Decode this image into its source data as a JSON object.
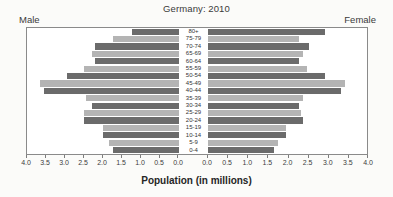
{
  "chart_data": {
    "type": "bar",
    "subtype": "population-pyramid",
    "title": "Germany: 2010",
    "xlabel": "Population (in millions)",
    "ylabel": "",
    "xlim": [
      0,
      4
    ],
    "grid": false,
    "legend_position": "none",
    "left_panel_label": "Male",
    "right_panel_label": "Female",
    "axis_ticks": [
      "0.0",
      "0.5",
      "1.0",
      "1.5",
      "2.0",
      "2.5",
      "3.0",
      "3.5",
      "4.0"
    ],
    "axis_tick_values": [
      0.0,
      0.5,
      1.0,
      1.5,
      2.0,
      2.5,
      3.0,
      3.5,
      4.0
    ],
    "left_axis_ticks": [
      "4.0",
      "3.5",
      "3.0",
      "2.5",
      "2.0",
      "1.5",
      "1.0",
      "0.5",
      "0.0"
    ],
    "right_axis_ticks": [
      "0.0",
      "0.5",
      "1.0",
      "1.5",
      "2.0",
      "2.5",
      "3.0",
      "3.5",
      "4.0"
    ],
    "categories": [
      "80+",
      "75-79",
      "70-74",
      "65-69",
      "60-64",
      "55-59",
      "50-54",
      "45-49",
      "40-44",
      "35-39",
      "30-34",
      "25-29",
      "20-24",
      "15-19",
      "10-14",
      "5-9",
      "0-4"
    ],
    "series": [
      {
        "name": "Male",
        "side": "left",
        "color": "#6e6e6e",
        "values": [
          1.25,
          1.75,
          2.2,
          2.3,
          2.2,
          2.5,
          2.95,
          3.65,
          3.55,
          2.45,
          2.3,
          2.5,
          2.5,
          2.0,
          2.0,
          1.85,
          1.75
        ]
      },
      {
        "name": "Female",
        "side": "right",
        "color": "#6e6e6e",
        "values": [
          2.95,
          2.3,
          2.55,
          2.4,
          2.3,
          2.5,
          2.95,
          3.45,
          3.35,
          2.4,
          2.3,
          2.35,
          2.4,
          1.95,
          1.95,
          1.75,
          1.65
        ]
      }
    ],
    "bar_colors": {
      "dark": "#6b6b6b",
      "light": "#b4b4b4",
      "alternating": true
    }
  }
}
